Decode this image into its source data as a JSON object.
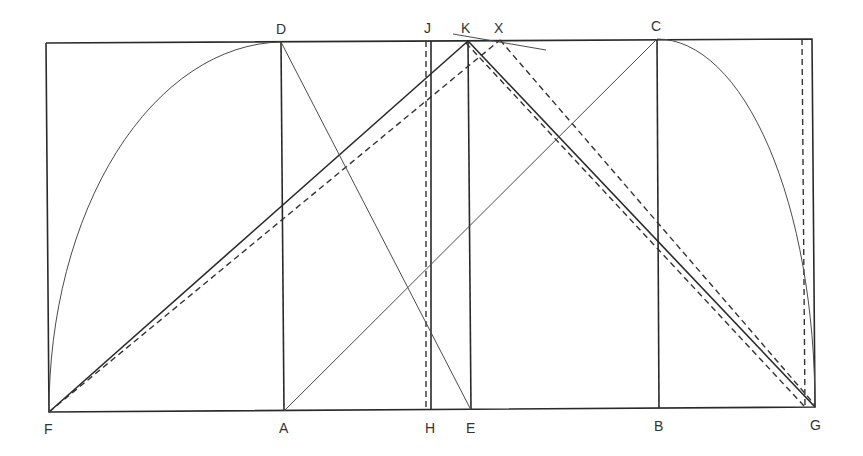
{
  "diagram": {
    "colors": {
      "stroke": "#2a2a2a",
      "label": "#333333",
      "background": "#ffffff"
    },
    "points": {
      "F": {
        "label": "F",
        "x": 49,
        "y": 412,
        "lx": 43,
        "ly": 434
      },
      "A": {
        "label": "A",
        "x": 284,
        "y": 411,
        "lx": 279,
        "ly": 433
      },
      "H": {
        "label": "H",
        "x": 431,
        "y": 410,
        "lx": 425,
        "ly": 433
      },
      "E": {
        "label": "E",
        "x": 471,
        "y": 410,
        "lx": 466,
        "ly": 433
      },
      "B": {
        "label": "B",
        "x": 659,
        "y": 408,
        "lx": 654,
        "ly": 431
      },
      "G": {
        "label": "G",
        "x": 815,
        "y": 407,
        "lx": 810,
        "ly": 430
      },
      "D": {
        "label": "D",
        "x": 281,
        "y": 42,
        "lx": 276,
        "ly": 34
      },
      "J": {
        "label": "J",
        "x": 431,
        "y": 41,
        "lx": 425,
        "ly": 33
      },
      "K": {
        "label": "K",
        "x": 468,
        "y": 41,
        "lx": 461,
        "ly": 33
      },
      "X": {
        "label": "X",
        "x": 500,
        "y": 40,
        "lx": 495,
        "ly": 33
      },
      "C": {
        "label": "C",
        "x": 657,
        "y": 39,
        "lx": 651,
        "ly": 31
      }
    },
    "labels": [
      "D",
      "J",
      "K",
      "X",
      "C",
      "F",
      "A",
      "H",
      "E",
      "B",
      "G"
    ]
  }
}
